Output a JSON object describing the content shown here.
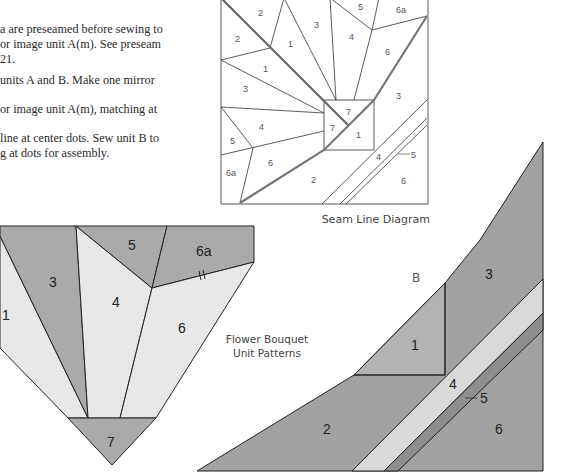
{
  "instructions": {
    "lines": [
      "a are preseamed before sewing to",
      "or image unit A(m). See preseam",
      "21.",
      "units A and B. Make one mirror",
      "or image unit A(m), matching at",
      "line at center dots. Sew unit B to",
      "g at dots for assembly."
    ]
  },
  "seam_diagram": {
    "caption": "Seam Line Diagram",
    "labels": [
      "2",
      "2",
      "1",
      "1",
      "3",
      "3",
      "5",
      "6a",
      "4",
      "6",
      "7",
      "7",
      "1",
      "3",
      "4",
      "5",
      "5",
      "6",
      "6a",
      "2",
      "4",
      "6"
    ]
  },
  "unit_a": {
    "labels": {
      "p1": "1",
      "p3": "3",
      "p4": "4",
      "p5": "5",
      "p6a": "6a",
      "p6": "6",
      "p7": "7"
    },
    "colors": {
      "dark": "#aaaaaa",
      "light": "#e8e8e8"
    }
  },
  "center_caption": {
    "line1": "Flower Bouquet",
    "line2": "Unit Patterns"
  },
  "unit_b": {
    "title": "B",
    "labels": {
      "p1": "1",
      "p2": "2",
      "p3": "3",
      "p4": "4",
      "p5": "5",
      "p6": "6"
    },
    "colors": {
      "dark": "#a2a2a2",
      "p1": "#b2b2b2",
      "stripe4": "#d9d9d9",
      "stripe5": "#8e8e8e"
    }
  }
}
